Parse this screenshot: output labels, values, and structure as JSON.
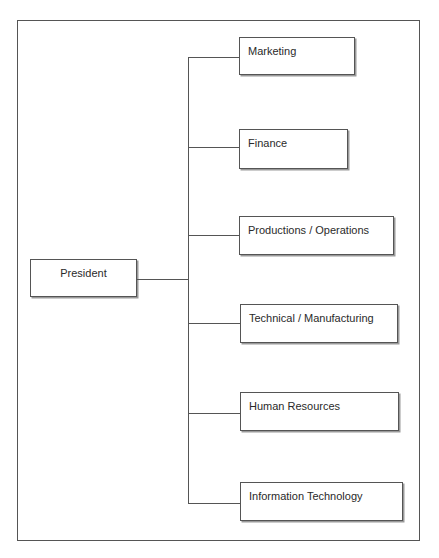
{
  "diagram": {
    "type": "org-chart",
    "root": {
      "label": "President"
    },
    "children": [
      {
        "label": "Marketing"
      },
      {
        "label": "Finance"
      },
      {
        "label": "Productions / Operations"
      },
      {
        "label": "Technical / Manufacturing"
      },
      {
        "label": "Human Resources"
      },
      {
        "label": "Information Technology"
      }
    ],
    "colors": {
      "line": "#555555",
      "box_fill": "#ffffff",
      "shadow": "#9a9a9a",
      "text": "#2a2a2a"
    }
  }
}
